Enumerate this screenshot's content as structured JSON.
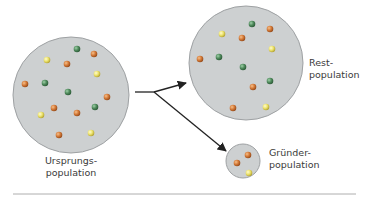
{
  "colors": {
    "population_fill": "#cdd0d1",
    "population_stroke": "#9ea1a3",
    "arrow": "#222222",
    "divider": "#9a9a9a",
    "allele_green": "#4f8a5c",
    "allele_orange": "#d47a38",
    "allele_yellow": "#ece36c"
  },
  "populations": {
    "source": {
      "label_line1": "Ursprungs-",
      "label_line2": "population",
      "cx": 71,
      "cy": 95,
      "r": 58,
      "dots": [
        {
          "x": 77,
          "y": 49,
          "c": "green"
        },
        {
          "x": 94,
          "y": 54,
          "c": "orange"
        },
        {
          "x": 47,
          "y": 60,
          "c": "yellow"
        },
        {
          "x": 67,
          "y": 64,
          "c": "orange"
        },
        {
          "x": 97,
          "y": 74,
          "c": "yellow"
        },
        {
          "x": 25,
          "y": 84,
          "c": "orange"
        },
        {
          "x": 45,
          "y": 83,
          "c": "green"
        },
        {
          "x": 68,
          "y": 92,
          "c": "green"
        },
        {
          "x": 107,
          "y": 97,
          "c": "orange"
        },
        {
          "x": 95,
          "y": 107,
          "c": "green"
        },
        {
          "x": 54,
          "y": 108,
          "c": "orange"
        },
        {
          "x": 77,
          "y": 113,
          "c": "orange"
        },
        {
          "x": 41,
          "y": 115,
          "c": "yellow"
        },
        {
          "x": 59,
          "y": 135,
          "c": "orange"
        },
        {
          "x": 91,
          "y": 133,
          "c": "yellow"
        }
      ]
    },
    "rest": {
      "label_line1": "Rest-",
      "label_line2": "population",
      "cx": 246,
      "cy": 63,
      "r": 57,
      "dots": [
        {
          "x": 252,
          "y": 24,
          "c": "green"
        },
        {
          "x": 270,
          "y": 29,
          "c": "orange"
        },
        {
          "x": 222,
          "y": 34,
          "c": "yellow"
        },
        {
          "x": 242,
          "y": 38,
          "c": "orange"
        },
        {
          "x": 272,
          "y": 49,
          "c": "yellow"
        },
        {
          "x": 200,
          "y": 59,
          "c": "orange"
        },
        {
          "x": 219,
          "y": 57,
          "c": "green"
        },
        {
          "x": 243,
          "y": 67,
          "c": "green"
        },
        {
          "x": 270,
          "y": 81,
          "c": "green"
        },
        {
          "x": 253,
          "y": 87,
          "c": "orange"
        },
        {
          "x": 233,
          "y": 108,
          "c": "orange"
        },
        {
          "x": 266,
          "y": 107,
          "c": "yellow"
        }
      ]
    },
    "founder": {
      "label_line1": "Gründer-",
      "label_line2": "population",
      "cx": 243,
      "cy": 161,
      "r": 17,
      "dots": [
        {
          "x": 248,
          "y": 155,
          "c": "orange"
        },
        {
          "x": 237,
          "y": 163,
          "c": "orange"
        },
        {
          "x": 249,
          "y": 173,
          "c": "yellow"
        }
      ]
    }
  }
}
